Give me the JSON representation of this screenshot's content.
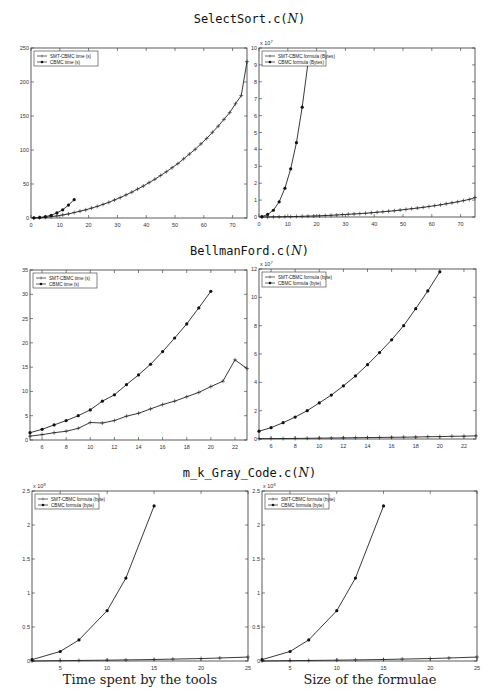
{
  "sections": [
    {
      "title_prefix": "SelectSort.c(",
      "title_arg": "N",
      "title_suffix": ")"
    },
    {
      "title_prefix": "BellmanFord.c(",
      "title_arg": "N",
      "title_suffix": ")"
    },
    {
      "title_prefix": "m_k_Gray_Code.c(",
      "title_arg": "N",
      "title_suffix": ")"
    }
  ],
  "captions": {
    "left": "Time spent by the tools",
    "right": "Size of the formulae"
  },
  "chart_data": [
    {
      "id": "selectsort-time",
      "type": "line",
      "title": "SelectSort.c(N) — Time spent by the tools",
      "xlabel": "",
      "ylabel": "",
      "xlim": [
        0,
        75
      ],
      "ylim": [
        0,
        250
      ],
      "xticks": [
        0,
        10,
        20,
        30,
        40,
        50,
        60,
        70
      ],
      "yticks": [
        0,
        50,
        100,
        150,
        200,
        250
      ],
      "exponent_label": "",
      "grid": false,
      "legend_position": "upper-left",
      "series": [
        {
          "name": "SMT-CBMC time (s)",
          "marker": "+",
          "x": [
            1,
            3,
            5,
            7,
            9,
            11,
            13,
            15,
            17,
            19,
            21,
            23,
            25,
            27,
            29,
            31,
            33,
            35,
            37,
            39,
            41,
            43,
            45,
            47,
            49,
            51,
            53,
            55,
            57,
            59,
            61,
            63,
            65,
            67,
            69,
            71,
            73,
            75
          ],
          "y": [
            0.1,
            0.4,
            1,
            2,
            3,
            4.5,
            6,
            8,
            10,
            12,
            14.5,
            17,
            20,
            23,
            26.5,
            30,
            34,
            38,
            42.5,
            47,
            52,
            57,
            62.5,
            68,
            74,
            80,
            87,
            94,
            101,
            109,
            117,
            126,
            135,
            145,
            155,
            168,
            180,
            230
          ]
        },
        {
          "name": "CBMC time (s)",
          "marker": "*",
          "x": [
            1,
            3,
            5,
            7,
            9,
            11,
            13,
            15
          ],
          "y": [
            0.2,
            0.8,
            2,
            4,
            7.5,
            12,
            19,
            27
          ]
        }
      ]
    },
    {
      "id": "selectsort-size",
      "type": "line",
      "title": "SelectSort.c(N) — Size of the formulae",
      "xlabel": "",
      "ylabel": "",
      "xlim": [
        0,
        75
      ],
      "ylim": [
        0,
        10
      ],
      "xticks": [
        0,
        10,
        20,
        30,
        40,
        50,
        60,
        70
      ],
      "yticks": [
        0,
        1,
        2,
        3,
        4,
        5,
        6,
        7,
        8,
        9,
        10
      ],
      "exponent_label": "x 10^7",
      "grid": false,
      "legend_position": "upper-left",
      "series": [
        {
          "name": "SMT-CBMC formula (Bytes)",
          "marker": "+",
          "x": [
            1,
            3,
            5,
            7,
            9,
            11,
            13,
            15,
            17,
            19,
            21,
            23,
            25,
            27,
            29,
            31,
            33,
            35,
            37,
            39,
            41,
            43,
            45,
            47,
            49,
            51,
            53,
            55,
            57,
            59,
            61,
            63,
            65,
            67,
            69,
            71,
            73,
            75
          ],
          "y": [
            0,
            0,
            0.01,
            0.01,
            0.02,
            0.02,
            0.03,
            0.04,
            0.05,
            0.06,
            0.07,
            0.09,
            0.1,
            0.12,
            0.14,
            0.16,
            0.18,
            0.2,
            0.22,
            0.25,
            0.28,
            0.31,
            0.34,
            0.37,
            0.41,
            0.45,
            0.49,
            0.53,
            0.57,
            0.62,
            0.67,
            0.72,
            0.78,
            0.84,
            0.9,
            0.97,
            1.04,
            1.15
          ]
        },
        {
          "name": "CBMC formula (Bytes)",
          "marker": "*",
          "x": [
            1,
            3,
            5,
            7,
            9,
            11,
            13,
            15,
            17
          ],
          "y": [
            0.02,
            0.15,
            0.4,
            0.9,
            1.7,
            2.85,
            4.4,
            6.5,
            9.1
          ]
        }
      ]
    },
    {
      "id": "bellmanford-time",
      "type": "line",
      "title": "BellmanFord.c(N) — Time spent by the tools",
      "xlabel": "",
      "ylabel": "",
      "xlim": [
        5,
        23
      ],
      "ylim": [
        0,
        35
      ],
      "xticks": [
        6,
        8,
        10,
        12,
        14,
        16,
        18,
        20,
        22
      ],
      "yticks": [
        0,
        5,
        10,
        15,
        20,
        25,
        30,
        35
      ],
      "exponent_label": "",
      "grid": false,
      "legend_position": "upper-left",
      "series": [
        {
          "name": "SMT-CBMC time (s)",
          "marker": "+",
          "x": [
            5,
            6,
            7,
            8,
            9,
            10,
            11,
            12,
            13,
            14,
            15,
            16,
            17,
            18,
            19,
            20,
            21,
            22,
            23
          ],
          "y": [
            0.8,
            1.1,
            1.5,
            1.8,
            2.4,
            3.6,
            3.5,
            4.0,
            4.9,
            5.5,
            6.4,
            7.3,
            8.0,
            8.9,
            9.8,
            11.0,
            12.1,
            16.5,
            14.7
          ]
        },
        {
          "name": "CBMC time (s)",
          "marker": "*",
          "x": [
            5,
            6,
            7,
            8,
            9,
            10,
            11,
            12,
            13,
            14,
            15,
            16,
            17,
            18,
            19,
            20
          ],
          "y": [
            1.5,
            2.2,
            3.1,
            4.0,
            5.0,
            6.2,
            8.0,
            9.3,
            11.4,
            13.4,
            15.6,
            18.2,
            21.0,
            23.9,
            27.2,
            30.6
          ]
        }
      ]
    },
    {
      "id": "bellmanford-size",
      "type": "line",
      "title": "BellmanFord.c(N) — Size of the formulae",
      "xlabel": "",
      "ylabel": "",
      "xlim": [
        5,
        23
      ],
      "ylim": [
        0,
        12
      ],
      "xticks": [
        6,
        8,
        10,
        12,
        14,
        16,
        18,
        20,
        22
      ],
      "yticks": [
        0,
        2,
        4,
        6,
        8,
        10,
        12
      ],
      "exponent_label": "x 10^7",
      "grid": false,
      "legend_position": "upper-left",
      "series": [
        {
          "name": "SMT-CBMC formula (byte)",
          "marker": "+",
          "x": [
            5,
            6,
            7,
            8,
            9,
            10,
            11,
            12,
            13,
            14,
            15,
            16,
            17,
            18,
            19,
            20,
            21,
            22,
            23
          ],
          "y": [
            0.02,
            0.03,
            0.03,
            0.04,
            0.05,
            0.06,
            0.07,
            0.08,
            0.09,
            0.1,
            0.11,
            0.12,
            0.13,
            0.14,
            0.16,
            0.17,
            0.19,
            0.2,
            0.22
          ]
        },
        {
          "name": "CBMC formula (byte)",
          "marker": "*",
          "x": [
            5,
            6,
            7,
            8,
            9,
            10,
            11,
            12,
            13,
            14,
            15,
            16,
            17,
            18,
            19,
            20
          ],
          "y": [
            0.55,
            0.8,
            1.15,
            1.55,
            2.0,
            2.55,
            3.1,
            3.75,
            4.45,
            5.25,
            6.1,
            7.0,
            8.0,
            9.2,
            10.45,
            11.8
          ]
        }
      ]
    },
    {
      "id": "graycode-time",
      "type": "line",
      "title": "m_k_Gray_Code.c(N) — Time spent by the tools",
      "xlabel": "",
      "ylabel": "",
      "xlim": [
        2,
        25
      ],
      "ylim": [
        0,
        2.5
      ],
      "xticks": [
        5,
        10,
        15,
        20,
        25
      ],
      "yticks": [
        0,
        0.5,
        1,
        1.5,
        2,
        2.5
      ],
      "exponent_label": "x 10^8",
      "grid": false,
      "legend_position": "upper-left",
      "series": [
        {
          "name": "SMT-CBMC formula (byte)",
          "marker": "+",
          "x": [
            2,
            5,
            7,
            10,
            12,
            15,
            17,
            20,
            22,
            25
          ],
          "y": [
            0.0,
            0.005,
            0.008,
            0.012,
            0.016,
            0.022,
            0.028,
            0.036,
            0.044,
            0.058
          ]
        },
        {
          "name": "CBMC formula (byte)",
          "marker": "*",
          "x": [
            2,
            5,
            7,
            10,
            12,
            15
          ],
          "y": [
            0.02,
            0.14,
            0.31,
            0.74,
            1.22,
            2.28
          ]
        }
      ]
    },
    {
      "id": "graycode-size",
      "type": "line",
      "title": "m_k_Gray_Code.c(N) — Size of the formulae",
      "xlabel": "",
      "ylabel": "",
      "xlim": [
        2,
        25
      ],
      "ylim": [
        0,
        2.5
      ],
      "xticks": [
        5,
        10,
        15,
        20,
        25
      ],
      "yticks": [
        0,
        0.5,
        1,
        1.5,
        2,
        2.5
      ],
      "exponent_label": "x 10^8",
      "grid": false,
      "legend_position": "upper-left",
      "series": [
        {
          "name": "SMT-CBMC formula (byte)",
          "marker": "+",
          "x": [
            2,
            5,
            7,
            10,
            12,
            15,
            17,
            20,
            22,
            25
          ],
          "y": [
            0.0,
            0.005,
            0.008,
            0.012,
            0.016,
            0.022,
            0.028,
            0.036,
            0.044,
            0.058
          ]
        },
        {
          "name": "CBMC formula (byte)",
          "marker": "*",
          "x": [
            2,
            5,
            7,
            10,
            12,
            15
          ],
          "y": [
            0.02,
            0.14,
            0.31,
            0.74,
            1.22,
            2.28
          ]
        }
      ]
    }
  ]
}
